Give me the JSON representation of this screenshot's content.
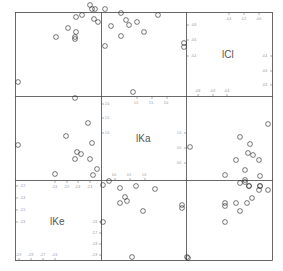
{
  "chart_data": {
    "type": "scatter",
    "title": "",
    "subtype": "scatterplot-matrix",
    "variables": [
      "lCl",
      "lKa",
      "lKe"
    ],
    "diagonal_labels": [
      "lCl",
      "lKa",
      "lKe"
    ],
    "grid": false,
    "legend": null,
    "axes": {
      "lCl": {
        "ticks": [
          "-0.8",
          "-0.6",
          "-0.4",
          "-0.2"
        ],
        "range": [
          -0.9,
          -0.1
        ]
      },
      "lKa": {
        "ticks": [
          "0.0",
          "0.5",
          "1.0",
          "1.5",
          "2.0"
        ],
        "range": [
          -0.2,
          2.2
        ]
      },
      "lKe": {
        "ticks": [
          "-2.9",
          "-2.8",
          "-2.7",
          "-2.6",
          "-2.5",
          "-2.4",
          "-2.3",
          "-2.2"
        ],
        "range": [
          -2.95,
          -2.15
        ]
      }
    },
    "panels": [
      {
        "row": 0,
        "col": 0,
        "x_var": "lKa",
        "y_var": "lCl",
        "marker": "open-square",
        "points_px": [
          [
            90,
            5
          ],
          [
            92,
            9
          ],
          [
            95,
            9
          ],
          [
            82,
            15
          ],
          [
            76,
            17
          ],
          [
            94,
            19
          ],
          [
            98,
            22
          ],
          [
            68,
            28
          ],
          [
            76,
            32
          ],
          [
            56,
            37
          ],
          [
            75,
            37
          ],
          [
            75,
            39
          ],
          [
            18,
            82
          ],
          [
            75,
            98
          ]
        ]
      },
      {
        "row": 0,
        "col": 1,
        "x_var": "lKe",
        "y_var": "lCl",
        "marker": "open-square",
        "points_px": [
          [
            105,
            9
          ],
          [
            158,
            15
          ],
          [
            121,
            13
          ],
          [
            126,
            20
          ],
          [
            129,
            25
          ],
          [
            137,
            22
          ],
          [
            111,
            26
          ],
          [
            144,
            32
          ],
          [
            121,
            36
          ],
          [
            105,
            46
          ],
          [
            184,
            43
          ],
          [
            184,
            47
          ],
          [
            133,
            92
          ]
        ]
      },
      {
        "row": 1,
        "col": 0,
        "x_var": "lKa",
        "y_var": "lKa",
        "marker": "open-square",
        "points_px": [
          [
            18,
            145
          ],
          [
            88,
            123
          ],
          [
            66,
            136
          ],
          [
            92,
            143
          ],
          [
            77,
            152
          ],
          [
            81,
            154
          ],
          [
            75,
            159
          ],
          [
            90,
            159
          ],
          [
            55,
            174
          ],
          [
            97,
            169
          ],
          [
            93,
            175
          ]
        ]
      },
      {
        "row": 1,
        "col": 2,
        "x_var": "lKe",
        "y_var": "lKa",
        "marker": "open-square",
        "points_px": [
          [
            268,
            124
          ],
          [
            240,
            137
          ],
          [
            250,
            144
          ],
          [
            248,
            153
          ],
          [
            253,
            155
          ],
          [
            236,
            160
          ],
          [
            259,
            160
          ],
          [
            245,
            170
          ],
          [
            225,
            175
          ],
          [
            260,
            176
          ],
          [
            245,
            182
          ],
          [
            249,
            186
          ],
          [
            260,
            186
          ],
          [
            190,
            147
          ]
        ]
      },
      {
        "row": 2,
        "col": 1,
        "x_var": "lKe",
        "y_var": "lKe",
        "marker": "open-square",
        "points_px": [
          [
            103,
            185
          ],
          [
            109,
            181
          ],
          [
            120,
            188
          ],
          [
            136,
            186
          ],
          [
            155,
            189
          ],
          [
            125,
            197
          ],
          [
            120,
            203
          ],
          [
            127,
            201
          ],
          [
            143,
            211
          ],
          [
            103,
            222
          ],
          [
            182,
            205
          ],
          [
            182,
            208
          ],
          [
            132,
            257
          ],
          [
            187,
            257
          ]
        ]
      },
      {
        "row": 2,
        "col": 2,
        "x_var": "lCl",
        "y_var": "lKe",
        "marker": "open-square",
        "points_px": [
          [
            245,
            180
          ],
          [
            240,
            183
          ],
          [
            249,
            186
          ],
          [
            260,
            186
          ],
          [
            259,
            190
          ],
          [
            268,
            190
          ],
          [
            252,
            198
          ],
          [
            247,
            203
          ],
          [
            236,
            203
          ],
          [
            225,
            203
          ],
          [
            225,
            206
          ],
          [
            240,
            211
          ],
          [
            225,
            222
          ],
          [
            188,
            258
          ]
        ]
      }
    ]
  }
}
